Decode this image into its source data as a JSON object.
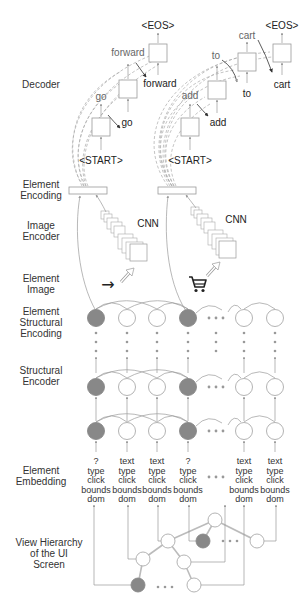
{
  "side_labels": {
    "decoder": [
      "Decoder"
    ],
    "element_encoding": [
      "Element",
      "Encoding"
    ],
    "image_encoder": [
      "Image",
      "Encoder"
    ],
    "element_image": [
      "Element",
      "Image"
    ],
    "element_structural_encoding": [
      "Element",
      "Structural",
      "Encoding"
    ],
    "structural_encoder": [
      "Structural",
      "Encoder"
    ],
    "element_embedding": [
      "Element",
      "Embedding"
    ],
    "view_hierarchy": [
      "View Hierarchy",
      "of the UI",
      "Screen"
    ]
  },
  "decoders": [
    {
      "start_token": "<START>",
      "eos_token": "<EOS>",
      "steps": [
        {
          "input": "go",
          "output": "go"
        },
        {
          "input": "forward",
          "output": "forward"
        }
      ]
    },
    {
      "start_token": "<START>",
      "eos_token": "<EOS>",
      "steps": [
        {
          "input": "add",
          "output": "add"
        },
        {
          "input": "to",
          "output": "to"
        },
        {
          "input": "cart",
          "output": "cart"
        }
      ]
    }
  ],
  "cnn_label": "CNN",
  "element_images": [
    {
      "icon": "arrow-right-icon",
      "glyph": "→"
    },
    {
      "icon": "shopping-cart-icon",
      "glyph": "cart"
    }
  ],
  "columns": [
    {
      "highlighted": true,
      "attrs": [
        "?",
        "type",
        "click",
        "bounds",
        "dom"
      ]
    },
    {
      "highlighted": false,
      "attrs": [
        "text",
        "type",
        "click",
        "bounds",
        "dom"
      ]
    },
    {
      "highlighted": false,
      "attrs": [
        "text",
        "type",
        "click",
        "bounds",
        "dom"
      ]
    },
    {
      "highlighted": true,
      "attrs": [
        "?",
        "type",
        "click",
        "bounds",
        "dom"
      ]
    },
    {
      "ellipsis": true
    },
    {
      "highlighted": false,
      "attrs": [
        "text",
        "type",
        "click",
        "bounds",
        "dom"
      ]
    },
    {
      "highlighted": false,
      "attrs": [
        "text",
        "type",
        "click",
        "bounds",
        "dom"
      ]
    }
  ],
  "colors": {
    "highlight_node": "#888888",
    "line": "#999999",
    "text": "#333333"
  }
}
